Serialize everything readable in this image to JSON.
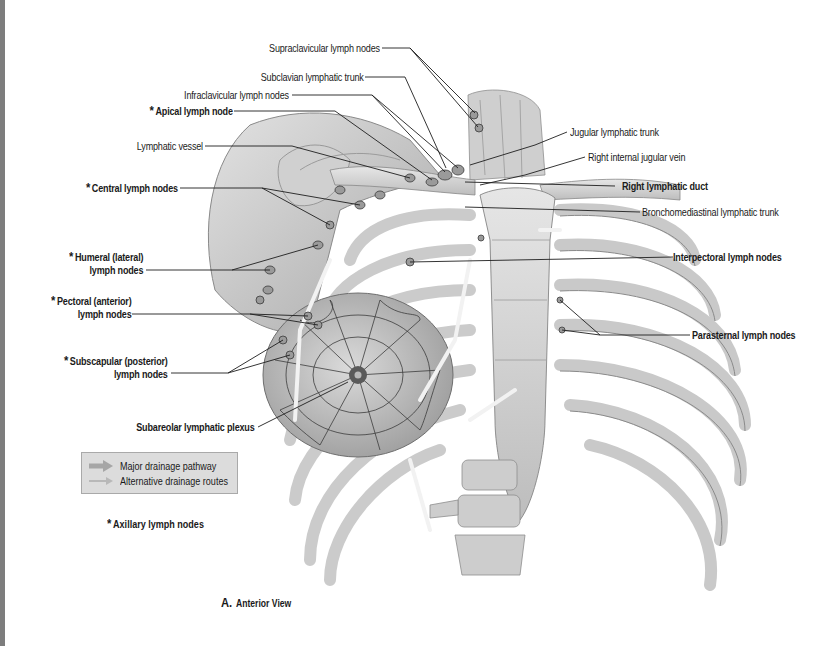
{
  "figure": {
    "caption_letter": "A.",
    "caption_text": "Anterior View"
  },
  "labels": {
    "supraclavicular": "Supraclavicular lymph nodes",
    "subclavian_trunk": "Subclavian lymphatic trunk",
    "infraclavicular": "Infraclavicular lymph nodes",
    "apical": "Apical lymph node",
    "lymphatic_vessel": "Lymphatic vessel",
    "central": "Central lymph nodes",
    "humeral_1": "Humeral (lateral)",
    "humeral_2": "lymph nodes",
    "pectoral_1": "Pectoral (anterior)",
    "pectoral_2": "lymph nodes",
    "subscapular_1": "Subscapular (posterior)",
    "subscapular_2": "lymph nodes",
    "subareolar": "Subareolar lymphatic plexus",
    "jugular_trunk": "Jugular lymphatic trunk",
    "internal_jugular": "Right internal jugular vein",
    "right_duct": "Right lymphatic duct",
    "bronchomediastinal": "Bronchomediastinal lymphatic trunk",
    "interpectoral": "Interpectoral lymph nodes",
    "parasternal": "Parasternal lymph nodes"
  },
  "asterisk": "*",
  "legend": {
    "items": [
      {
        "label": "Major drainage pathway",
        "icon": "thick-arrow-icon",
        "color": "#a6a6a6"
      },
      {
        "label": "Alternative drainage routes",
        "icon": "thin-arrow-icon",
        "color": "#b8b8b8"
      }
    ],
    "footnote": "Axillary lymph nodes"
  },
  "colors": {
    "bone": "#d6d6d6",
    "bone_shadow": "#9a9a9a",
    "skin": "#c9c9c9",
    "line": "#2a2a2a",
    "node": "#8c8c8c",
    "legend_bg": "#dcdcdc"
  }
}
